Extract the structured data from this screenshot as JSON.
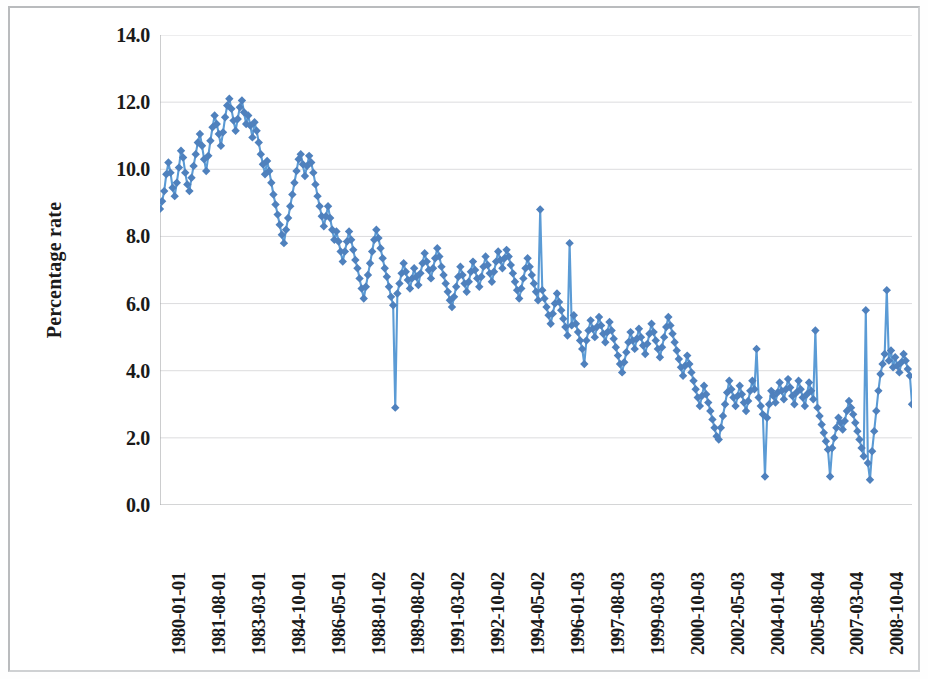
{
  "chart_data": {
    "type": "line",
    "title": "",
    "subtitle": "",
    "xlabel": "",
    "ylabel": "Percentage rate",
    "ylim": [
      0.0,
      14.0
    ],
    "yticks": [
      "0.0",
      "2.0",
      "4.0",
      "6.0",
      "8.0",
      "10.0",
      "12.0",
      "14.0"
    ],
    "ytick_values": [
      0,
      2,
      4,
      6,
      8,
      10,
      12,
      14
    ],
    "grid": "horizontal",
    "legend": "none",
    "marker": "diamond",
    "series_color": "#4F81BD",
    "line_color": "#5B9BD5",
    "xtick_labels": [
      "1980-01-01",
      "1981-08-01",
      "1983-03-01",
      "1984-10-01",
      "1986-05-01",
      "1988-01-02",
      "1989-08-02",
      "1991-03-02",
      "1992-10-02",
      "1994-05-02",
      "1996-01-03",
      "1997-08-03",
      "1999-03-03",
      "2000-10-03",
      "2002-05-03",
      "2004-01-04",
      "2005-08-04",
      "2007-03-04",
      "2008-10-04"
    ],
    "xtick_interval_points": 19,
    "x_start": "1980-01-01",
    "x_end": "2009-05-01",
    "n_points": 353,
    "values": [
      8.82,
      9.05,
      9.35,
      9.85,
      10.2,
      9.9,
      9.45,
      9.2,
      9.6,
      10.05,
      10.55,
      10.35,
      9.9,
      9.55,
      9.35,
      9.75,
      10.1,
      10.45,
      10.8,
      11.05,
      10.7,
      10.3,
      9.95,
      10.4,
      10.85,
      11.25,
      11.6,
      11.35,
      11.05,
      10.7,
      11.1,
      11.55,
      11.9,
      12.1,
      11.8,
      11.45,
      11.15,
      11.5,
      11.85,
      12.05,
      11.7,
      11.35,
      11.6,
      11.3,
      10.95,
      11.4,
      11.15,
      10.8,
      10.45,
      10.15,
      9.85,
      10.25,
      9.95,
      9.6,
      9.25,
      8.95,
      8.65,
      8.35,
      8.05,
      7.8,
      8.2,
      8.55,
      8.9,
      9.25,
      9.6,
      9.95,
      10.3,
      10.45,
      10.15,
      9.8,
      10.1,
      10.4,
      10.2,
      9.9,
      9.55,
      9.2,
      8.9,
      8.6,
      8.3,
      8.6,
      8.9,
      8.55,
      8.2,
      7.9,
      8.15,
      7.85,
      7.55,
      7.25,
      7.55,
      7.85,
      8.15,
      7.9,
      7.6,
      7.3,
      7.05,
      6.75,
      6.45,
      6.15,
      6.5,
      6.85,
      7.2,
      7.55,
      7.9,
      8.2,
      7.95,
      7.65,
      7.35,
      7.05,
      6.8,
      6.5,
      6.2,
      5.95,
      2.9,
      6.3,
      6.6,
      6.9,
      7.2,
      6.95,
      6.7,
      6.45,
      6.75,
      7.05,
      6.8,
      6.55,
      6.9,
      7.2,
      7.5,
      7.25,
      7.0,
      6.75,
      7.05,
      7.35,
      7.65,
      7.4,
      7.1,
      6.85,
      6.6,
      6.35,
      6.1,
      5.9,
      6.2,
      6.5,
      6.8,
      7.1,
      6.85,
      6.6,
      6.35,
      6.65,
      6.95,
      7.25,
      7.0,
      6.75,
      6.5,
      6.8,
      7.1,
      7.4,
      7.15,
      6.9,
      6.65,
      6.95,
      7.25,
      7.55,
      7.3,
      7.05,
      7.35,
      7.6,
      7.4,
      7.15,
      6.9,
      6.65,
      6.4,
      6.15,
      6.45,
      6.75,
      7.05,
      7.35,
      7.1,
      6.85,
      6.6,
      6.35,
      6.1,
      8.8,
      6.4,
      6.15,
      5.9,
      5.65,
      5.4,
      5.7,
      6.0,
      6.3,
      6.05,
      5.8,
      5.55,
      5.3,
      5.05,
      7.8,
      5.35,
      5.65,
      5.4,
      5.15,
      4.9,
      4.65,
      4.2,
      4.9,
      5.2,
      5.5,
      5.25,
      5.0,
      5.3,
      5.6,
      5.35,
      5.1,
      4.85,
      5.15,
      5.45,
      5.2,
      4.95,
      4.7,
      4.45,
      4.2,
      3.95,
      4.25,
      4.55,
      4.85,
      5.15,
      4.9,
      4.65,
      4.95,
      5.25,
      5.0,
      4.75,
      4.5,
      4.8,
      5.1,
      5.4,
      5.15,
      4.9,
      4.65,
      4.4,
      4.7,
      5.0,
      5.3,
      5.6,
      5.35,
      5.1,
      4.85,
      4.6,
      4.35,
      4.1,
      3.85,
      4.15,
      4.45,
      4.2,
      3.95,
      3.7,
      3.45,
      3.2,
      2.95,
      3.25,
      3.55,
      3.3,
      3.05,
      2.8,
      2.55,
      2.3,
      2.05,
      1.95,
      2.3,
      2.65,
      3.0,
      3.35,
      3.7,
      3.45,
      3.2,
      2.95,
      3.25,
      3.55,
      3.3,
      3.05,
      2.8,
      3.1,
      3.4,
      3.7,
      3.45,
      4.65,
      3.2,
      2.95,
      2.7,
      0.85,
      2.6,
      3.0,
      3.4,
      3.25,
      3.05,
      3.35,
      3.65,
      3.4,
      3.15,
      3.45,
      3.75,
      3.5,
      3.25,
      3.0,
      3.35,
      3.7,
      3.45,
      3.2,
      2.95,
      3.3,
      3.65,
      3.4,
      3.15,
      5.2,
      2.9,
      2.65,
      2.4,
      2.15,
      1.9,
      1.65,
      0.85,
      1.7,
      2.0,
      2.3,
      2.6,
      2.45,
      2.25,
      2.5,
      2.8,
      3.1,
      2.9,
      2.7,
      2.45,
      2.2,
      1.95,
      1.7,
      1.45,
      5.8,
      1.25,
      0.75,
      1.6,
      2.2,
      2.8,
      3.4,
      3.9,
      4.2,
      4.5,
      6.4,
      4.3,
      4.6,
      4.1,
      4.4,
      4.15,
      3.95,
      4.25,
      4.5,
      4.3,
      4.05,
      3.85,
      3.0
    ]
  }
}
